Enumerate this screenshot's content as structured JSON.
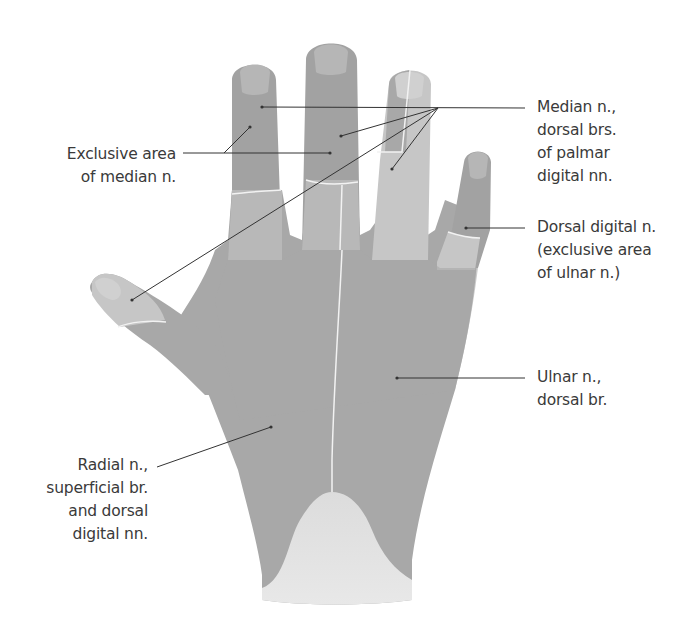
{
  "figure": {
    "colors": {
      "skin_shaded": "#a3a3a3",
      "skin_light": "#c8c8c8",
      "skin_wrist": "#dcdcdc",
      "boundary_line": "#f2f2f2",
      "leader_line": "#333333",
      "text": "#3a3a3a",
      "background": "#ffffff"
    }
  },
  "labels": {
    "exclusive_median": {
      "lines": [
        "Exclusive area",
        "of median n."
      ]
    },
    "median_dorsal": {
      "lines": [
        "Median n.,",
        "dorsal brs.",
        "of palmar",
        "digital nn."
      ]
    },
    "dorsal_digital_ulnar": {
      "lines": [
        "Dorsal digital n.",
        "(exclusive area",
        "of ulnar n.)"
      ]
    },
    "ulnar_dorsal": {
      "lines": [
        "Ulnar n.,",
        "dorsal br."
      ]
    },
    "radial_superficial": {
      "lines": [
        "Radial n.,",
        "superficial br.",
        "and dorsal",
        "digital nn."
      ]
    }
  }
}
